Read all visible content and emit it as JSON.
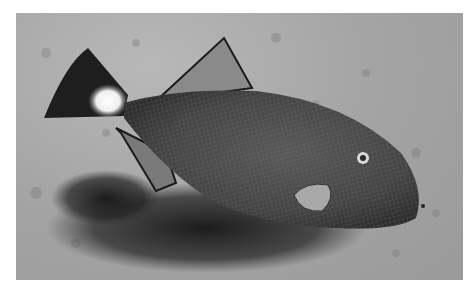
{
  "image": {
    "subject": "Triggerfish swimming over sandy seabed",
    "style": "grayscale photograph",
    "alt": "A triggerfish with a dark tail fin marked by a white patch, swimming left-to-right above a speckled sandy floor, casting a dark shadow below"
  },
  "colors": {
    "border": "#ffffff",
    "sand": "#a8a8a8",
    "body": "#4a4a4a",
    "shadow": "#1e1e1e",
    "tail_patch": "#f4f4f4"
  }
}
